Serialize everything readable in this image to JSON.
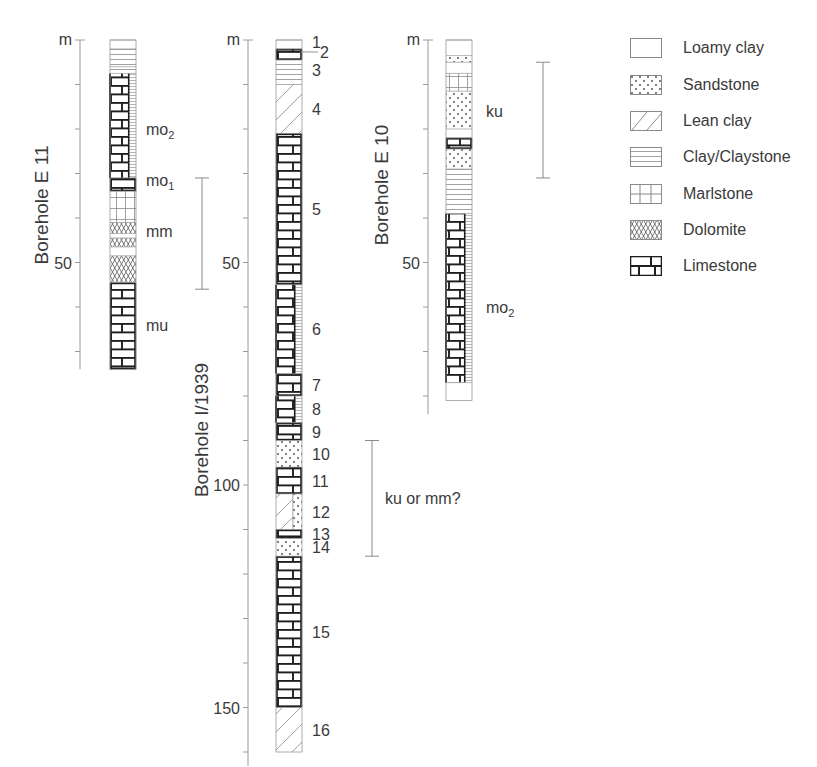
{
  "figure": {
    "type": "borehole-logs",
    "depth_unit": "m",
    "scale_px_per_m": 4.45
  },
  "boreholes": [
    {
      "id": "E11",
      "title": "Borehole E 11",
      "unit_label": "m",
      "tick_labels": [
        {
          "depth": 50,
          "label": "50"
        }
      ],
      "total_depth_m": 74,
      "layers": [
        {
          "top": 0,
          "bottom": 2,
          "lith": "loamy"
        },
        {
          "top": 2,
          "bottom": 6,
          "lith": "clay"
        },
        {
          "top": 6,
          "bottom": 7.5,
          "lith": "clay"
        },
        {
          "top": 7.5,
          "bottom": 31,
          "lith": "limestone_marl_half"
        },
        {
          "top": 31,
          "bottom": 34,
          "lith": "limestone"
        },
        {
          "top": 34,
          "bottom": 41,
          "lith": "marl"
        },
        {
          "top": 41,
          "bottom": 43.5,
          "lith": "dolomite"
        },
        {
          "top": 43.5,
          "bottom": 44.5,
          "lith": "loamy"
        },
        {
          "top": 44.5,
          "bottom": 46.5,
          "lith": "dolomite"
        },
        {
          "top": 46.5,
          "bottom": 48.5,
          "lith": "loamy"
        },
        {
          "top": 48.5,
          "bottom": 54.5,
          "lith": "dolomite"
        },
        {
          "top": 54.5,
          "bottom": 74,
          "lith": "limestone"
        }
      ],
      "strat_labels": [
        {
          "text": "mo",
          "sub": "2",
          "depth": 20
        },
        {
          "text": "mo",
          "sub": "1",
          "depth": 31.5
        },
        {
          "text": "mm",
          "depth": 43
        },
        {
          "text": "mu",
          "depth": 64
        }
      ],
      "range_bar": {
        "top": 31,
        "bottom": 56
      }
    },
    {
      "id": "I1939",
      "title": "Borehole I/1939",
      "unit_label": "m",
      "tick_labels": [
        {
          "depth": 50,
          "label": "50"
        },
        {
          "depth": 100,
          "label": "100"
        },
        {
          "depth": 150,
          "label": "150"
        }
      ],
      "total_depth_m": 160,
      "layers": [
        {
          "top": 0,
          "bottom": 2,
          "lith": "loamy",
          "num": "1"
        },
        {
          "top": 2,
          "bottom": 4.5,
          "lith": "limestone",
          "num": "2"
        },
        {
          "top": 4.5,
          "bottom": 10,
          "lith": "clay",
          "num": "3"
        },
        {
          "top": 10,
          "bottom": 21,
          "lith": "leanclay",
          "num": "4"
        },
        {
          "top": 21,
          "bottom": 55,
          "lith": "limestone",
          "num": "5"
        },
        {
          "top": 55,
          "bottom": 75,
          "lith": "limestone_clay_half",
          "num": "6"
        },
        {
          "top": 75,
          "bottom": 80,
          "lith": "limestone",
          "num": "7"
        },
        {
          "top": 80,
          "bottom": 86,
          "lith": "limestone_clay_half",
          "num": "8"
        },
        {
          "top": 86,
          "bottom": 90,
          "lith": "limestone",
          "num": "9"
        },
        {
          "top": 90,
          "bottom": 96,
          "lith": "sandstone",
          "num": "10"
        },
        {
          "top": 96,
          "bottom": 102,
          "lith": "limestone",
          "num": "11"
        },
        {
          "top": 102,
          "bottom": 110,
          "lith": "leanclay_sand_half",
          "num": "12"
        },
        {
          "top": 110,
          "bottom": 112,
          "lith": "limestone",
          "num": "13"
        },
        {
          "top": 112,
          "bottom": 116,
          "lith": "sandstone",
          "num": "14"
        },
        {
          "top": 116,
          "bottom": 150,
          "lith": "limestone",
          "num": "15"
        },
        {
          "top": 150,
          "bottom": 160,
          "lith": "leanclay",
          "num": "16"
        }
      ],
      "range_bar": {
        "top": 90,
        "bottom": 116,
        "label": "ku or mm?"
      }
    },
    {
      "id": "E10",
      "title": "Borehole E 10",
      "unit_label": "m",
      "tick_labels": [
        {
          "depth": 50,
          "label": "50"
        }
      ],
      "total_depth_m": 81,
      "layers": [
        {
          "top": 0,
          "bottom": 3.5,
          "lith": "loamy"
        },
        {
          "top": 3.5,
          "bottom": 5,
          "lith": "sandstone"
        },
        {
          "top": 5,
          "bottom": 7.5,
          "lith": "loamy"
        },
        {
          "top": 7.5,
          "bottom": 11.5,
          "lith": "marl"
        },
        {
          "top": 11.5,
          "bottom": 20,
          "lith": "sandstone"
        },
        {
          "top": 20,
          "bottom": 22,
          "lith": "loamy"
        },
        {
          "top": 22,
          "bottom": 24.5,
          "lith": "limestone"
        },
        {
          "top": 24.5,
          "bottom": 29,
          "lith": "sandstone"
        },
        {
          "top": 29,
          "bottom": 39,
          "lith": "clay"
        },
        {
          "top": 39,
          "bottom": 77,
          "lith": "limestone_clay_half"
        },
        {
          "top": 77,
          "bottom": 81,
          "lith": "loamy"
        }
      ],
      "strat_labels": [
        {
          "text": "ku",
          "depth": 16
        },
        {
          "text": "mo",
          "sub": "2",
          "depth": 60
        }
      ],
      "range_bar": {
        "top": 5,
        "bottom": 31
      }
    }
  ],
  "legend": {
    "items": [
      {
        "key": "loamy",
        "label": "Loamy clay"
      },
      {
        "key": "sandstone",
        "label": "Sandstone"
      },
      {
        "key": "leanclay",
        "label": "Lean clay"
      },
      {
        "key": "clay",
        "label": "Clay/Claystone"
      },
      {
        "key": "marl",
        "label": "Marlstone"
      },
      {
        "key": "dolomite",
        "label": "Dolomite"
      },
      {
        "key": "limestone",
        "label": "Limestone"
      }
    ]
  },
  "colors": {
    "ink": "#2b2b2b",
    "light_ink": "#8a8a8a",
    "axis": "#9a9a9a",
    "text": "#3a3a3a"
  }
}
